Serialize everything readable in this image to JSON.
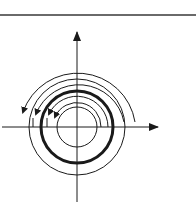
{
  "diagram": {
    "type": "phase-portrait",
    "center": [
      77,
      127
    ],
    "axes": {
      "x_axis": {
        "from": [
          2,
          127
        ],
        "to": [
          158,
          127
        ],
        "arrow": true
      },
      "y_axis": {
        "from": [
          77,
          202
        ],
        "to": [
          77,
          32
        ],
        "arrow": true
      }
    },
    "limit_cycle": {
      "radius": 36,
      "stroke_width": 3
    },
    "closed_orbits": [
      {
        "radius": 20,
        "stroke_width": 1
      },
      {
        "radius": 48,
        "stroke_width": 1
      }
    ],
    "spiral_arcs": [
      {
        "name": "inner-spiral-1",
        "r_start": 24,
        "r_end": 26,
        "direction": "counterclockwise"
      },
      {
        "name": "inner-spiral-2",
        "r_start": 29,
        "r_end": 31,
        "direction": "counterclockwise"
      },
      {
        "name": "outer-spiral-1",
        "r_start": 44,
        "r_end": 42,
        "direction": "counterclockwise"
      },
      {
        "name": "outer-spiral-2",
        "r_start": 58,
        "r_end": 55,
        "direction": "counterclockwise"
      }
    ],
    "colors": {
      "line": "#1a1a1a",
      "rule": "#6a6a6a",
      "background": "#ffffff"
    }
  }
}
